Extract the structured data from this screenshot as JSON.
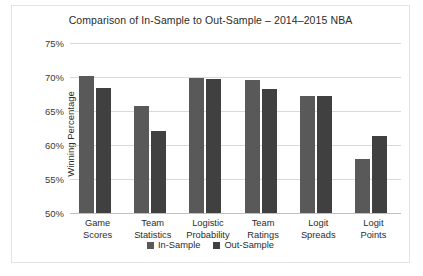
{
  "chart_data": {
    "type": "bar",
    "title": "Comparison of In-Sample to Out-Sample – 2014–2015 NBA",
    "xlabel": "",
    "ylabel": "Winning Percentage",
    "ylim": [
      50,
      75
    ],
    "ytick_labels": [
      "75%",
      "70%",
      "65%",
      "60%",
      "55%",
      "50%"
    ],
    "ytick_values": [
      75,
      70,
      65,
      60,
      55,
      50
    ],
    "grid": true,
    "legend_position": "bottom",
    "categories": [
      "Game\nScores",
      "Team\nStatistics",
      "Logistic\nProbability",
      "Team\nRatings",
      "Logit\nSpreads",
      "Logit\nPoints"
    ],
    "category_lines": [
      [
        "Game",
        "Scores"
      ],
      [
        "Team",
        "Statistics"
      ],
      [
        "Logistic",
        "Probability"
      ],
      [
        "Team",
        "Ratings"
      ],
      [
        "Logit",
        "Spreads"
      ],
      [
        "Logit",
        "Points"
      ]
    ],
    "series": [
      {
        "name": "In-Sample",
        "color": "#595959",
        "values": [
          70.1,
          65.7,
          69.8,
          69.5,
          67.2,
          57.9
        ]
      },
      {
        "name": "Out-Sample",
        "color": "#404040",
        "values": [
          68.4,
          62.0,
          69.7,
          68.3,
          67.2,
          61.3
        ]
      }
    ]
  },
  "colors": {
    "in_sample": "#595959",
    "out_sample": "#404040",
    "gridline": "#d9d9d9",
    "border": "#e3e3e3",
    "text": "#2b2b2b"
  }
}
